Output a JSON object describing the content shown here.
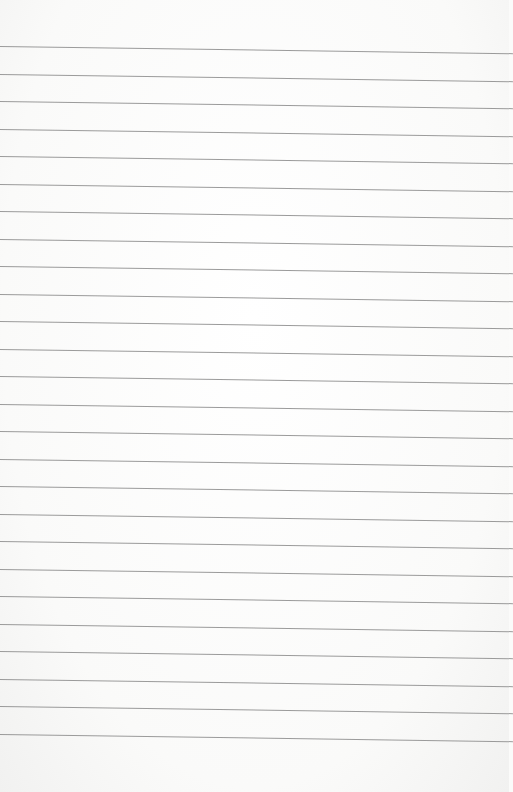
{
  "page": {
    "line_count": 26,
    "first_line_y": 46,
    "line_spacing": 27.5,
    "line_color": "#8a8a8a",
    "paper_color": "#fbfbfa"
  }
}
